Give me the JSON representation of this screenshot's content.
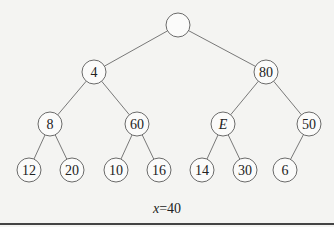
{
  "diagram": {
    "type": "binary-tree",
    "nodes": [
      {
        "id": "root",
        "label": "",
        "x": 178,
        "y": 25
      },
      {
        "id": "n4",
        "label": "4",
        "x": 94,
        "y": 72
      },
      {
        "id": "n80",
        "label": "80",
        "x": 266,
        "y": 72
      },
      {
        "id": "n8",
        "label": "8",
        "x": 50,
        "y": 124
      },
      {
        "id": "n60",
        "label": "60",
        "x": 137,
        "y": 124
      },
      {
        "id": "nE",
        "label": "E",
        "x": 223,
        "y": 124,
        "italic": true
      },
      {
        "id": "n50",
        "label": "50",
        "x": 309,
        "y": 124
      },
      {
        "id": "n12",
        "label": "12",
        "x": 29,
        "y": 170
      },
      {
        "id": "n20",
        "label": "20",
        "x": 72,
        "y": 170
      },
      {
        "id": "n10",
        "label": "10",
        "x": 116,
        "y": 170
      },
      {
        "id": "n16",
        "label": "16",
        "x": 159,
        "y": 170
      },
      {
        "id": "n14",
        "label": "14",
        "x": 202,
        "y": 170
      },
      {
        "id": "n30",
        "label": "30",
        "x": 245,
        "y": 170
      },
      {
        "id": "n6",
        "label": "6",
        "x": 285,
        "y": 170
      }
    ],
    "edges": [
      [
        "root",
        "n4"
      ],
      [
        "root",
        "n80"
      ],
      [
        "n4",
        "n8"
      ],
      [
        "n4",
        "n60"
      ],
      [
        "n80",
        "nE"
      ],
      [
        "n80",
        "n50"
      ],
      [
        "n8",
        "n12"
      ],
      [
        "n8",
        "n20"
      ],
      [
        "n60",
        "n10"
      ],
      [
        "n60",
        "n16"
      ],
      [
        "nE",
        "n14"
      ],
      [
        "nE",
        "n30"
      ],
      [
        "n50",
        "n6"
      ]
    ],
    "node_radius": 12
  },
  "caption": {
    "variable": "x",
    "equals": "=",
    "value": "40"
  }
}
